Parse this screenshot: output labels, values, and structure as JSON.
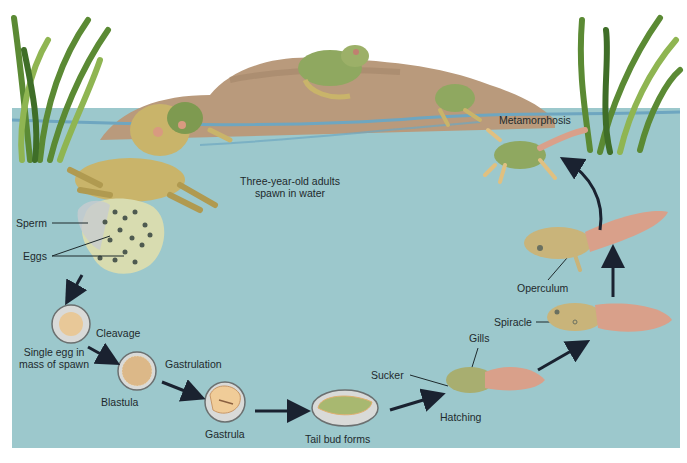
{
  "diagram": {
    "colors": {
      "water": "#9cc8cc",
      "rock": "#b99a7c",
      "reed": "#6f9a3e",
      "frog": "#c9b46a",
      "tadpole_tail": "#d9a08a",
      "arrow": "#1a2230",
      "label": "#1e2a2c"
    },
    "labels": {
      "adults": "Three-year-old adults",
      "adults_line2": "spawn in water",
      "sperm": "Sperm",
      "eggs": "Eggs",
      "cleavage": "Cleavage",
      "single_egg": "Single egg in",
      "single_egg_line2": "mass of spawn",
      "gastrulation": "Gastrulation",
      "blastula": "Blastula",
      "gastrula": "Gastrula",
      "tail_bud": "Tail bud forms",
      "sucker": "Sucker",
      "gills": "Gills",
      "hatching": "Hatching",
      "spiracle": "Spiracle",
      "operculum": "Operculum",
      "metamorphosis": "Metamorphosis"
    },
    "stages": [
      "Three-year-old adults spawn in water",
      "Eggs",
      "Single egg in mass of spawn",
      "Cleavage",
      "Blastula",
      "Gastrulation",
      "Gastrula",
      "Tail bud forms",
      "Hatching",
      "Spiracle",
      "Operculum",
      "Metamorphosis"
    ]
  }
}
